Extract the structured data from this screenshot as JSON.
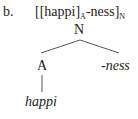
{
  "example": {
    "marker": "b.",
    "bracketing": {
      "open": "[[",
      "root": "happi",
      "inner_close": "]",
      "inner_category": "A",
      "suffix": "-ness",
      "outer_close": "]",
      "outer_category": "N"
    }
  },
  "tree": {
    "root_node": "N",
    "left_child": "A",
    "right_child": "-ness",
    "leaf": "happi"
  },
  "colors": {
    "text": "#222222",
    "lines": "#555555"
  }
}
